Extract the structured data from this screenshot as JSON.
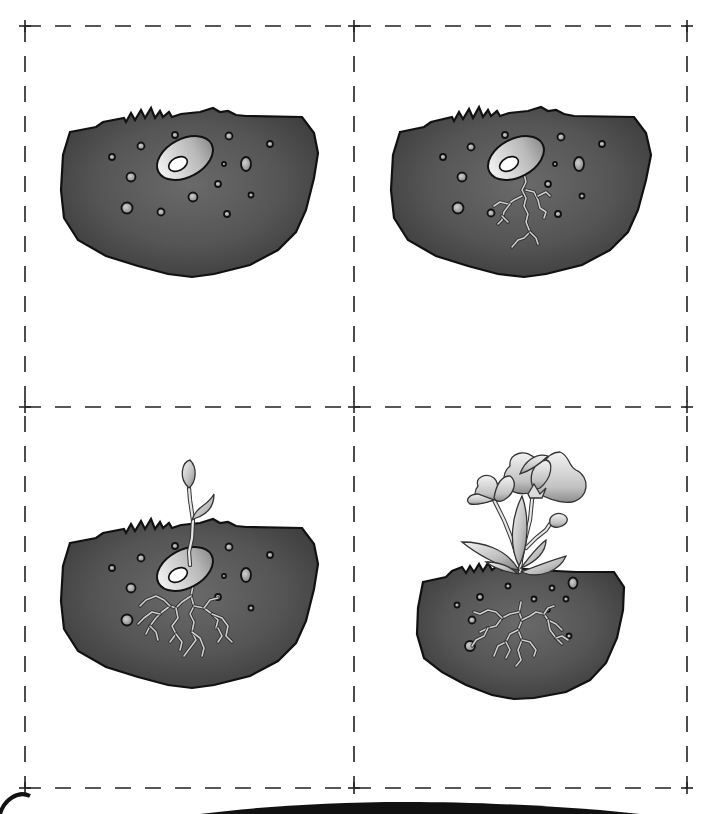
{
  "colors": {
    "soil_dark": "#3d3d3d",
    "soil_mid": "#5e5e5e",
    "soil_light": "#6e6e6e",
    "seed_light": "#efefef",
    "seed_dark": "#9a9a9a",
    "petal_light": "#f2f2f2",
    "petal_dark": "#8c8c8c",
    "line": "#111111"
  },
  "grid": {
    "left": 25,
    "center_x": 354,
    "right": 687,
    "top": 26,
    "center_y": 407,
    "bottom": 788
  },
  "cards": [
    {
      "stage": 1,
      "name": "seed-in-soil",
      "dx": 0,
      "dy": 0,
      "soil_path": "M70,132 L96,127 L103,122 L124,118 L126,122 L131,113 L135,120 L141,110 L145,118 L151,108 L155,118 L160,111 L163,117 L169,112 L172,117 L181,114 L200,112 L213,108 L220,112 L228,111 L236,115 L246,116 L302,117 L314,133 L318,153 L314,178 L306,210 L296,232 L278,250 L250,265 L214,274 L192,277 L168,274 L138,266 L106,256 L78,240 L64,218 L61,190 L63,155 Z",
      "seed": {
        "cx": 185,
        "cy": 158,
        "rx": 30,
        "ry": 19,
        "rot": -28,
        "hole_cx": 178,
        "hole_cy": 164,
        "hole_rx": 10,
        "hole_ry": 6.5
      },
      "pebbles": [
        [
          175,
          135,
          3
        ],
        [
          229,
          136,
          3.5
        ],
        [
          270,
          144,
          3
        ],
        [
          141,
          146,
          3.5
        ],
        [
          112,
          157,
          3
        ],
        [
          246,
          164,
          5,
          7
        ],
        [
          224,
          164,
          2
        ],
        [
          131,
          177,
          4.5
        ],
        [
          218,
          184,
          3
        ],
        [
          193,
          197,
          4.5
        ],
        [
          251,
          195,
          2.5
        ],
        [
          127,
          208,
          5.5
        ],
        [
          161,
          212,
          3.5
        ],
        [
          227,
          214,
          3
        ]
      ],
      "roots": [],
      "sprout": false,
      "flower": false
    },
    {
      "stage": 2,
      "name": "seed-with-roots",
      "dx": 0,
      "dy": 0,
      "soil_path": "M400,132 L424,127 L431,122 L452,117 L454,121 L459,112 L463,119 L469,109 L473,118 L479,107 L483,117 L488,110 L491,116 L497,111 L500,116 L509,113 L528,111 L541,107 L548,111 L556,110 L564,114 L574,116 L634,117 L646,133 L651,155 L646,180 L638,210 L628,232 L610,250 L582,265 L546,274 L524,277 L498,274 L468,266 L436,256 L408,240 L394,218 L391,190 L393,155 Z",
      "seed": {
        "cx": 516,
        "cy": 158,
        "rx": 30,
        "ry": 19,
        "rot": -28,
        "hole_cx": 509,
        "hole_cy": 164,
        "hole_rx": 10,
        "hole_ry": 6.5
      },
      "pebbles": [
        [
          505,
          135,
          3
        ],
        [
          561,
          137,
          3.5
        ],
        [
          602,
          144,
          3
        ],
        [
          471,
          147,
          3.5
        ],
        [
          443,
          157,
          3
        ],
        [
          579,
          164,
          5,
          7
        ],
        [
          555,
          164,
          2
        ],
        [
          462,
          177,
          4.5
        ],
        [
          548,
          184,
          3
        ],
        [
          582,
          196,
          2.5
        ],
        [
          458,
          208,
          5.5
        ],
        [
          491,
          213,
          3.5
        ],
        [
          558,
          214,
          3
        ]
      ],
      "roots": [
        "M524,174 L526,182 L522,190 L526,198 L524,206 L528,214 L526,222 L530,232 L524,238 L518,240 L512,247",
        "M526,190 L534,192 L538,200 L540,208 L546,212 L544,218",
        "M538,196 L546,192 L550,196",
        "M522,196 L514,200 L508,204 L500,202 L494,206",
        "M510,204 L504,212 L502,220 L498,224",
        "M502,216 L508,222",
        "M530,232 L536,238 L538,244"
      ],
      "sprout": false,
      "flower": false
    },
    {
      "stage": 3,
      "name": "seedling",
      "dx": 0,
      "dy": 0,
      "soil_path": "M70,543 L96,538 L103,533 L124,529 L126,533 L131,524 L135,531 L141,521 L145,529 L151,519 L155,529 L160,522 L163,528 L169,523 L172,528 L181,525 L200,523 L213,519 L220,523 L228,522 L236,526 L246,527 L302,528 L314,544 L318,564 L314,589 L306,621 L296,643 L278,661 L250,676 L214,685 L192,688 L168,685 L138,677 L106,667 L78,651 L64,629 L61,601 L63,566 Z",
      "seed": {
        "cx": 185,
        "cy": 569,
        "rx": 30,
        "ry": 19,
        "rot": -28,
        "hole_cx": 178,
        "hole_cy": 575,
        "hole_rx": 10,
        "hole_ry": 6.5
      },
      "pebbles": [
        [
          175,
          546,
          3
        ],
        [
          229,
          547,
          3.5
        ],
        [
          270,
          555,
          3
        ],
        [
          141,
          558,
          3.5
        ],
        [
          112,
          568,
          3
        ],
        [
          246,
          575,
          5,
          7
        ],
        [
          224,
          576,
          2
        ],
        [
          131,
          588,
          4.5
        ],
        [
          218,
          597,
          3
        ],
        [
          251,
          608,
          2.5
        ],
        [
          127,
          620,
          5.5
        ]
      ],
      "roots": [
        "M193,586 L191,596 L194,606 L190,614 L194,622 L192,632 L196,640 L190,648 L184,656",
        "M191,596 L182,602 L176,608 L170,606 L162,612 L156,618 L150,626 L146,634",
        "M170,606 L164,600 L156,596 L146,600 L140,606",
        "M160,614 L152,612 L144,618 L138,624",
        "M176,608 L178,618 L172,626 L176,634 L170,642",
        "M194,606 L204,608 L212,614 L218,620 L216,628",
        "M204,608 L210,600 L218,598",
        "M212,614 L222,618 L228,626 L226,636 L232,642",
        "M218,628 L222,636 L218,642",
        "M192,632 L200,638 L204,648 L202,656",
        "M176,634 L182,642 L180,650",
        "M150,626 L156,632 L158,640"
      ],
      "sprout": {
        "stem": "M190,565 L189,552 L192,538 L193,520 L190,500 L189,488",
        "leaf1": "M189,488 C178,478 182,462 190,460 C198,468 196,482 189,488 Z",
        "leaf2": "M192,520 C196,506 208,506 214,494 C214,506 208,514 196,518 Z"
      },
      "flower": false
    },
    {
      "stage": 4,
      "name": "flowering-plant",
      "dx": 0,
      "dy": 0,
      "soil_path": "M423,582 L446,577 L452,571 L462,567 L466,573 L470,566 L474,572 L479,564 L483,571 L488,563 L492,570 L498,565 L502,570 L509,567 L516,568 L526,569 L536,570 L576,572 L614,572 L624,587 L623,610 L617,638 L606,663 L590,680 L566,692 L534,698 L514,699 L492,695 L466,685 L442,672 L424,658 L417,634 L418,608 Z",
      "seed": false,
      "pebbles": [
        [
          508,
          586,
          2.5
        ],
        [
          552,
          588,
          2.5
        ],
        [
          573,
          583,
          4.5,
          5.5
        ],
        [
          480,
          597,
          3
        ],
        [
          534,
          599,
          2.5
        ],
        [
          566,
          599,
          2.5
        ],
        [
          457,
          605,
          2.5
        ],
        [
          548,
          610,
          1.8
        ],
        [
          472,
          620,
          3.5
        ],
        [
          569,
          636,
          2.5
        ],
        [
          470,
          646,
          5
        ]
      ],
      "roots": [
        "M521,602 L519,612 L522,620 L518,630 L522,640 L518,650 L521,660 L516,666",
        "M519,612 L510,614 L502,618 L496,626 L488,628 L480,632",
        "M502,618 L496,612 L488,610 L480,614 L474,612",
        "M488,628 L484,636 L476,640 L472,646",
        "M522,620 L530,616 L536,612 L544,614 L548,620 L556,624 L562,630",
        "M544,614 L548,608 L554,606",
        "M548,620 L550,630 L556,638 L562,644",
        "M522,640 L530,642 L536,650 L534,656",
        "M518,630 L510,634 L506,642 L498,646 L494,656",
        "M506,642 L510,650 L506,658",
        "M556,638 L562,636 L568,640"
      ],
      "sprout": false,
      "flower": {
        "main_stem": "M520,572 L521,560 L525,540 L530,520 L532,500 L534,492",
        "side_stem": "M519,562 L512,540 L504,520 L498,508 L494,500",
        "bud_stem": "M526,548 L536,538 L546,530 L550,524",
        "leaves": [
          "M519,570 C500,568 474,552 462,542 C482,542 506,548 519,570 Z",
          "M519,566 C508,544 512,516 522,496 C530,518 528,548 519,566 Z",
          "M521,572 C536,566 552,560 566,556 C560,570 540,580 521,572 Z",
          "M521,568 C530,556 538,546 546,540 C546,552 536,562 521,568 Z",
          "M518,574 C506,572 494,568 486,562 C498,562 510,566 518,574 Z"
        ],
        "big_flower": {
          "petals": [
            "M534,492 C508,500 496,478 510,466 C508,452 528,448 536,460 C540,470 538,484 534,492 Z",
            "M536,492 C540,470 544,452 560,452 C570,456 568,466 576,470 C590,476 590,498 572,502 C558,504 546,498 536,492 Z",
            "M534,490 C528,478 532,462 546,460 C554,462 552,478 540,488 Z",
            "M520,474 C524,462 536,452 548,456 C540,464 532,470 520,474 Z"
          ],
          "sepal": "M528,494 L534,484 L540,494 L546,488 L542,498 L530,498 Z"
        },
        "small_flower": {
          "petals": [
            "M494,500 C480,506 470,496 478,486 C474,478 486,472 494,478 C500,484 498,494 494,500 Z",
            "M494,498 C496,486 500,476 510,476 C518,482 514,494 504,500 C500,502 496,502 494,498 Z",
            "M478,494 C470,494 464,500 470,504 C478,506 488,502 494,500 Z"
          ]
        },
        "bud": "M550,524 C548,516 556,512 562,514 C568,516 570,522 562,526 C558,528 552,528 550,524 Z"
      }
    }
  ],
  "bottom_decor": {
    "left_arc": "M0,814 C4,800 18,790 30,796",
    "right_swoosh": "M200,814 C300,802 420,796 600,810 L640,814 Z"
  }
}
